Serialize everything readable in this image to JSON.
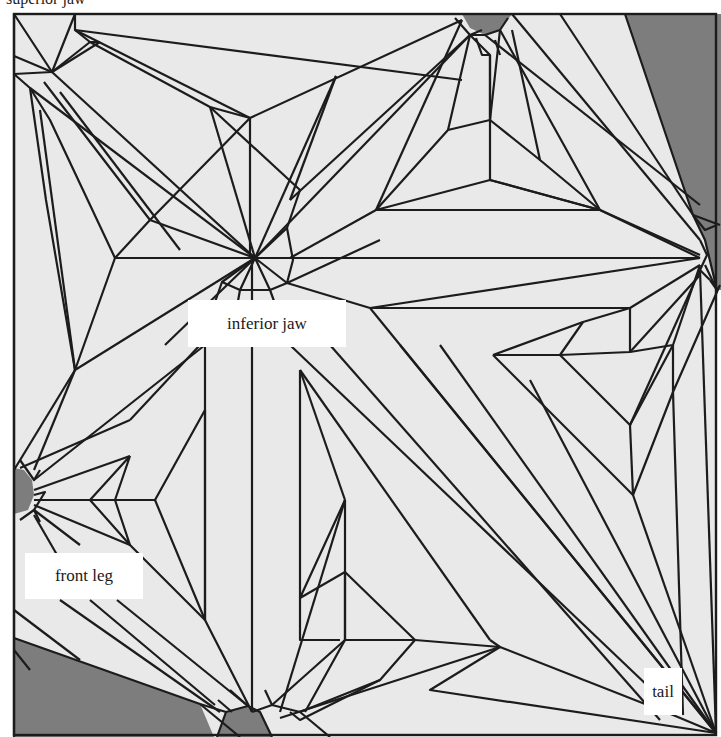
{
  "diagram": {
    "type": "origami crease pattern",
    "clipped_top_label": "superior jaw",
    "labels": {
      "inferior_jaw": "inferior jaw",
      "front_leg": "front leg",
      "tail": "tail"
    },
    "colors": {
      "paper": "#e9e9e9",
      "crease": "#1c1c1c",
      "unused_region": "#7d7d7d",
      "label_bg": "#ffffff"
    },
    "square": {
      "x": 14,
      "y": 14,
      "size": 702
    }
  }
}
